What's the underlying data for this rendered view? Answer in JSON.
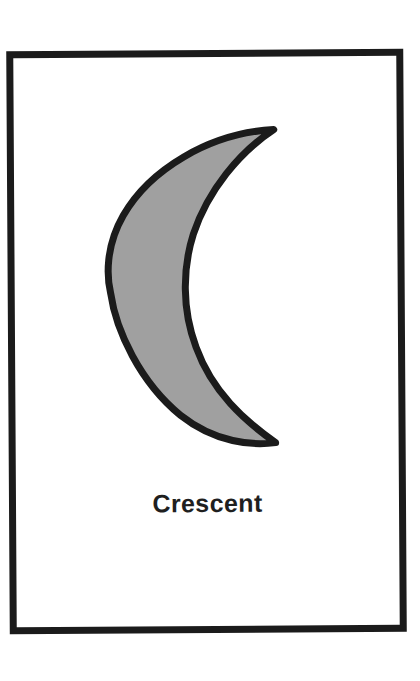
{
  "page": {
    "background_color": "#ffffff",
    "width": 420,
    "height": 681
  },
  "frame": {
    "name": "card-border",
    "stroke_color": "#1b1b1b",
    "stroke_width": 7,
    "x": 8,
    "y": 50,
    "width": 383,
    "height": 569
  },
  "figure": {
    "shape_name": "crescent",
    "fill_color": "#a0a0a0",
    "outline_color": "#1b1b1b",
    "outline_width": 7,
    "opens_toward": "right",
    "top_tip": [
      275,
      130
    ],
    "bottom_tip": [
      275,
      443
    ],
    "leftmost_x": 111,
    "inner_curve_x_at_center": 191,
    "vertical_center": 287
  },
  "label": {
    "text": "Crescent",
    "color": "#1f1f1f",
    "font_size_px": 25,
    "font_weight": "bold",
    "align": "center"
  }
}
